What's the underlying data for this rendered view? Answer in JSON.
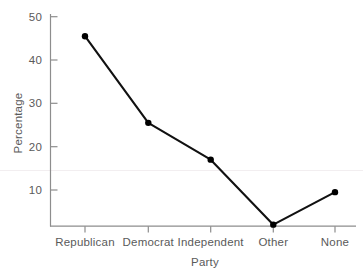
{
  "chart_data": {
    "type": "line",
    "title": "",
    "xlabel": "Party",
    "ylabel": "Percentage",
    "categories": [
      "Republican",
      "Democrat",
      "Independent",
      "Other",
      "None"
    ],
    "values": [
      45.5,
      25.5,
      17,
      2,
      9.5
    ],
    "series": [
      {
        "name": "Percentage",
        "values": [
          45.5,
          25.5,
          17,
          2,
          9.5
        ]
      }
    ],
    "ylim": [
      0,
      50
    ],
    "yticks": [
      10,
      20,
      30,
      40,
      50
    ],
    "ytick_labels": [
      "10",
      "20",
      "30",
      "40",
      "50"
    ],
    "grid": false,
    "legend": "none",
    "marker": "filled-circle",
    "line_color": "#000000",
    "marker_color": "#000000",
    "axis_color": "#808080",
    "text_color": "#5a5a5a",
    "background": "#ffffff"
  },
  "axis": {
    "y_title": "Percentage",
    "x_title": "Party",
    "y_tick_0": "10",
    "y_tick_1": "20",
    "y_tick_2": "30",
    "y_tick_3": "40",
    "y_tick_4": "50",
    "x_tick_0": "Republican",
    "x_tick_1": "Democrat",
    "x_tick_2": "Independent",
    "x_tick_3": "Other",
    "x_tick_4": "None"
  }
}
